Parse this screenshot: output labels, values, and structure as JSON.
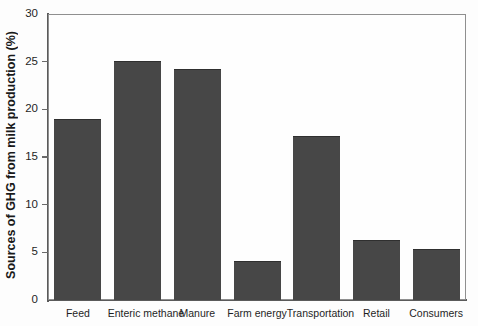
{
  "chart_data": {
    "type": "bar",
    "title": "",
    "subtitle": "",
    "xlabel": "",
    "ylabel": "Sources of GHG from milk production (%)",
    "categories": [
      "Feed",
      "Enteric methane",
      "Manure",
      "Farm energy",
      "Transportation",
      "Retail",
      "Consumers"
    ],
    "values": [
      19.0,
      25.1,
      24.2,
      4.1,
      17.2,
      6.3,
      5.3
    ],
    "ylim": [
      0,
      30
    ],
    "yticks": [
      0,
      5,
      10,
      15,
      20,
      25,
      30
    ],
    "ytick_labels": [
      "0",
      "5",
      "10",
      "15",
      "20",
      "25",
      "30"
    ],
    "grid": false,
    "legend": "none",
    "bar_color": "#474747",
    "axis_color": "#5a5a5a",
    "background_color": "#fdfdfd"
  }
}
